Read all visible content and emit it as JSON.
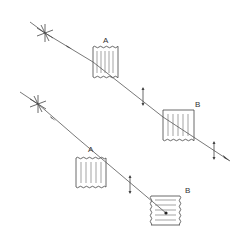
{
  "diagram": {
    "type": "optical polarization schematic",
    "colors": {
      "line": "#444444",
      "background": "#ffffff"
    },
    "top_system": {
      "source_label": "",
      "filter_a_label": "A",
      "filter_b_label": "B",
      "filter_a_lines": "vertical",
      "filter_b_lines": "vertical",
      "light_transmitted": true
    },
    "bottom_system": {
      "source_label": "",
      "filter_a_label": "A",
      "filter_b_label": "B",
      "filter_a_lines": "vertical",
      "filter_b_lines": "horizontal",
      "light_transmitted": false
    }
  }
}
